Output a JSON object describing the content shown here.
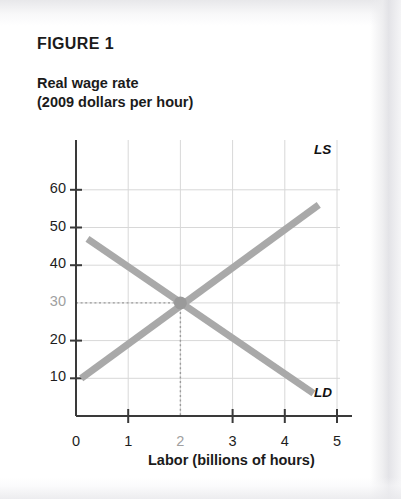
{
  "figure": {
    "title": "FIGURE 1",
    "y_axis_title": "Real wage rate\n(2009 dollars per hour)",
    "x_axis_title": "Labor (billions of hours)"
  },
  "labels": {
    "ls": "LS",
    "ld": "LD"
  },
  "colors": {
    "curve": "#a9a9a9",
    "axis": "#3a3a3a",
    "grid": "#d8d8d8",
    "text": "#1b1b1b",
    "muted_text": "#a0a0a0",
    "equilibrium_dot": "#9a9a9a",
    "paper": "#ffffff"
  },
  "chart_data": {
    "type": "line",
    "title": "FIGURE 1",
    "xlabel": "Labor (billions of hours)",
    "ylabel": "Real wage rate (2009 dollars per hour)",
    "xlim": [
      0,
      5.6
    ],
    "ylim": [
      0,
      64
    ],
    "xticks": [
      0,
      1,
      2,
      3,
      4,
      5
    ],
    "xtick_labels": [
      "0",
      "1",
      "2",
      "3",
      "4",
      "5"
    ],
    "yticks": [
      10,
      20,
      30,
      40,
      50,
      60
    ],
    "ytick_labels": [
      "10",
      "20",
      "30",
      "40",
      "50",
      "60"
    ],
    "grid": true,
    "legend": "inline-endpoint-labels",
    "highlighted_ticks": {
      "x": "2",
      "y": "30"
    },
    "series": [
      {
        "name": "LS",
        "label": "LS",
        "description": "Labor supply, upward sloping",
        "x": [
          0.1,
          4.65
        ],
        "y": [
          10,
          56
        ]
      },
      {
        "name": "LD",
        "label": "LD",
        "description": "Labor demand, downward sloping",
        "x": [
          0.22,
          4.55
        ],
        "y": [
          47,
          6
        ]
      }
    ],
    "annotations": [
      {
        "type": "point",
        "name": "equilibrium",
        "x": 2,
        "y": 30,
        "guides": [
          "horizontal-dotted-to-y-axis",
          "vertical-dotted-to-x-axis"
        ]
      }
    ]
  }
}
